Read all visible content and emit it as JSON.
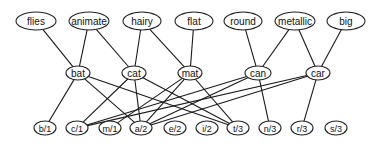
{
  "diagram": {
    "title": "",
    "layers": {
      "attributes": [
        {
          "id": "flies",
          "label": "flies",
          "x": 36,
          "y": 21,
          "rx": 20,
          "ry": 9
        },
        {
          "id": "animate",
          "label": "animate",
          "x": 89,
          "y": 21,
          "rx": 20,
          "ry": 9
        },
        {
          "id": "hairy",
          "label": "hairy",
          "x": 142,
          "y": 21,
          "rx": 19,
          "ry": 9
        },
        {
          "id": "flat",
          "label": "flat",
          "x": 194,
          "y": 21,
          "rx": 19,
          "ry": 9
        },
        {
          "id": "round",
          "label": "round",
          "x": 243,
          "y": 21,
          "rx": 19,
          "ry": 9
        },
        {
          "id": "metallic",
          "label": "metallic",
          "x": 295,
          "y": 21,
          "rx": 20,
          "ry": 9
        },
        {
          "id": "big",
          "label": "big",
          "x": 346,
          "y": 21,
          "rx": 19,
          "ry": 9
        }
      ],
      "words": [
        {
          "id": "bat",
          "label": "bat",
          "x": 78,
          "y": 73,
          "rx": 12,
          "ry": 7
        },
        {
          "id": "cat",
          "label": "cat",
          "x": 134,
          "y": 73,
          "rx": 12,
          "ry": 7
        },
        {
          "id": "mat",
          "label": "mat",
          "x": 190,
          "y": 73,
          "rx": 12,
          "ry": 7
        },
        {
          "id": "can",
          "label": "can",
          "x": 258,
          "y": 73,
          "rx": 13,
          "ry": 7
        },
        {
          "id": "car",
          "label": "car",
          "x": 318,
          "y": 73,
          "rx": 12,
          "ry": 7
        }
      ],
      "letters": [
        {
          "id": "b1",
          "label": "b/1",
          "x": 45,
          "y": 128,
          "rx": 11,
          "ry": 7
        },
        {
          "id": "c1",
          "label": "c/1",
          "x": 77,
          "y": 128,
          "rx": 11,
          "ry": 7
        },
        {
          "id": "m1",
          "label": "m/1",
          "x": 110,
          "y": 128,
          "rx": 11,
          "ry": 7
        },
        {
          "id": "a2",
          "label": "a/2",
          "x": 141,
          "y": 128,
          "rx": 11,
          "ry": 7
        },
        {
          "id": "e2",
          "label": "e/2",
          "x": 175,
          "y": 128,
          "rx": 11,
          "ry": 7
        },
        {
          "id": "i2",
          "label": "i/2",
          "x": 207,
          "y": 128,
          "rx": 11,
          "ry": 7
        },
        {
          "id": "t3",
          "label": "t/3",
          "x": 238,
          "y": 128,
          "rx": 11,
          "ry": 7
        },
        {
          "id": "n3",
          "label": "n/3",
          "x": 270,
          "y": 128,
          "rx": 11,
          "ry": 7
        },
        {
          "id": "r3",
          "label": "r/3",
          "x": 302,
          "y": 128,
          "rx": 11,
          "ry": 7
        },
        {
          "id": "s3",
          "label": "s/3",
          "x": 336,
          "y": 128,
          "rx": 11,
          "ry": 7
        }
      ]
    },
    "edges": [
      [
        "flies",
        "bat"
      ],
      [
        "animate",
        "bat"
      ],
      [
        "animate",
        "cat"
      ],
      [
        "hairy",
        "cat"
      ],
      [
        "hairy",
        "mat"
      ],
      [
        "flat",
        "mat"
      ],
      [
        "round",
        "can"
      ],
      [
        "metallic",
        "can"
      ],
      [
        "metallic",
        "car"
      ],
      [
        "big",
        "car"
      ],
      [
        "bat",
        "b1"
      ],
      [
        "bat",
        "a2"
      ],
      [
        "bat",
        "t3"
      ],
      [
        "cat",
        "c1"
      ],
      [
        "cat",
        "a2"
      ],
      [
        "cat",
        "t3"
      ],
      [
        "mat",
        "m1"
      ],
      [
        "mat",
        "a2"
      ],
      [
        "mat",
        "t3"
      ],
      [
        "can",
        "c1"
      ],
      [
        "can",
        "a2"
      ],
      [
        "can",
        "n3"
      ],
      [
        "car",
        "c1"
      ],
      [
        "car",
        "a2"
      ],
      [
        "car",
        "r3"
      ]
    ],
    "colors": {
      "stroke": "#1a1a1a",
      "fill": "#ffffff",
      "text": "#111111"
    }
  }
}
